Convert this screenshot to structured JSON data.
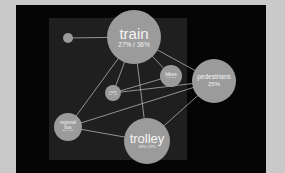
{
  "colors": {
    "page_background": "#c9c9c9",
    "frame": "#050505",
    "inner_panel": "#1f1f1f",
    "node_fill": "#9b9b9b",
    "edge": "#b8b8b8",
    "text": "#f4f4f4"
  },
  "nodes": [
    {
      "id": "misc",
      "name": "…",
      "pct": "",
      "cx": 68,
      "cy": 38,
      "r": 5
    },
    {
      "id": "train",
      "name": "train",
      "pct": "27% / 36%",
      "cx": 134,
      "cy": 37,
      "r": 27
    },
    {
      "id": "bikes",
      "name": "bikes",
      "pct": "1% / 1%",
      "cx": 171,
      "cy": 76,
      "r": 11
    },
    {
      "id": "pedestrians",
      "name": "pedestrians",
      "pct": "25%",
      "cx": 214,
      "cy": 81,
      "r": 22
    },
    {
      "id": "cars",
      "name": "cars",
      "pct": "1% / 1%",
      "cx": 113,
      "cy": 93,
      "r": 8
    },
    {
      "id": "regional_bus",
      "name": "regional bus",
      "pct": "15% / 13%",
      "cx": 68,
      "cy": 127,
      "r": 14
    },
    {
      "id": "trolley",
      "name": "trolley",
      "pct": "28% / 27%",
      "cx": 147,
      "cy": 141,
      "r": 23
    }
  ],
  "edges": [
    [
      "misc",
      "train"
    ],
    [
      "train",
      "bikes"
    ],
    [
      "train",
      "pedestrians"
    ],
    [
      "train",
      "cars"
    ],
    [
      "train",
      "regional_bus"
    ],
    [
      "train",
      "trolley"
    ],
    [
      "bikes",
      "cars"
    ],
    [
      "cars",
      "pedestrians"
    ],
    [
      "regional_bus",
      "pedestrians"
    ],
    [
      "regional_bus",
      "trolley"
    ],
    [
      "trolley",
      "pedestrians"
    ]
  ],
  "labels": {
    "misc": {
      "name": "",
      "pct": ""
    },
    "train": {
      "name": "train",
      "pct": "27% / 36%"
    },
    "bikes": {
      "name": "bikes",
      "pct": "1% / 1%"
    },
    "pedestrians": {
      "name": "pedestrians",
      "pct": "25%"
    },
    "cars": {
      "name": "cars",
      "pct": "1% / 1%"
    },
    "regional_bus": {
      "name": "regional",
      "name2": "bus",
      "pct": "15% / 13%"
    },
    "trolley": {
      "name": "trolley",
      "pct": "28% / 27%"
    }
  }
}
